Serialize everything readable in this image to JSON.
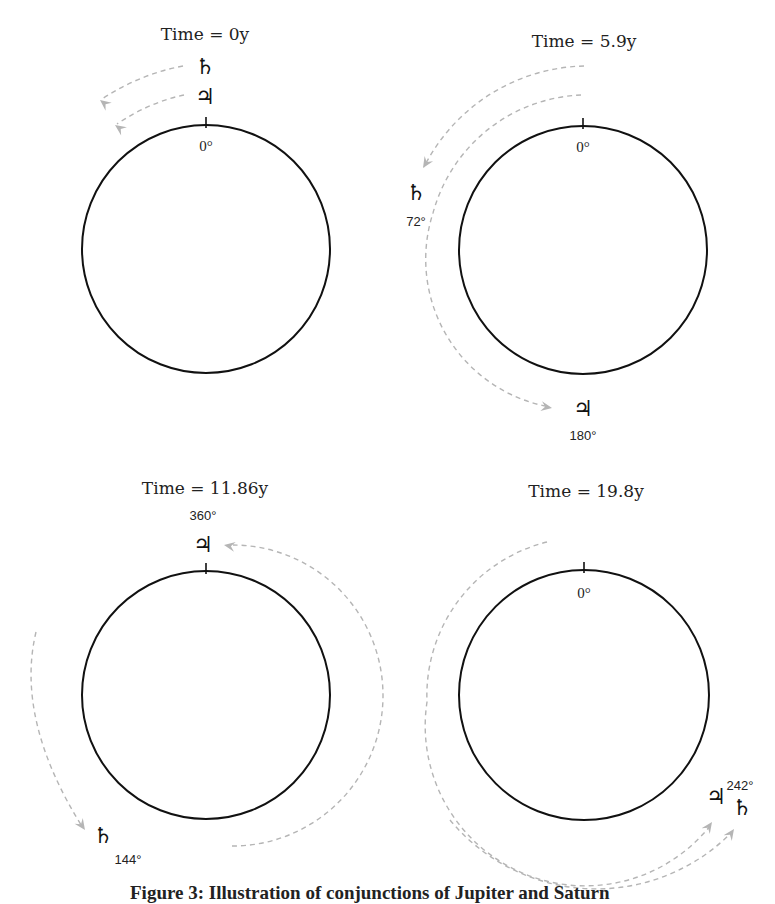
{
  "figure": {
    "caption": "Figure 3: Illustration of  conjunctions of Jupiter and Saturn",
    "colors": {
      "orbit": "#111111",
      "arc": "#b5b5b5",
      "text": "#222222"
    },
    "symbols": {
      "jupiter": "♃",
      "saturn": "♄"
    },
    "panels": [
      {
        "id": "t0",
        "title": "Time = 0y",
        "title_pos": [
          205,
          40
        ],
        "circle": {
          "cx": 206,
          "cy": 249,
          "r": 124
        },
        "zero_label": {
          "text": "0°",
          "x": 206,
          "y": 151
        },
        "bodies": [
          {
            "name": "saturn",
            "symbol": "♄",
            "x": 205,
            "y": 74
          },
          {
            "name": "jupiter",
            "symbol": "♃",
            "x": 205,
            "y": 104
          }
        ],
        "angle_labels": [],
        "arcs": [
          {
            "d": "M 183 66 Q 140 74 102 99",
            "arrow": [
              100,
              100,
              218
            ]
          },
          {
            "d": "M 184 95 Q 150 102 117 124",
            "arrow": [
              115,
              125,
              215
            ]
          }
        ]
      },
      {
        "id": "t5_9",
        "title": "Time = 5.9y",
        "title_pos": [
          584,
          47
        ],
        "circle": {
          "cx": 583,
          "cy": 250,
          "r": 124
        },
        "zero_label": {
          "text": "0°",
          "x": 583,
          "y": 152
        },
        "bodies": [
          {
            "name": "saturn",
            "symbol": "♄",
            "x": 416,
            "y": 200
          },
          {
            "name": "jupiter",
            "symbol": "♃",
            "x": 583,
            "y": 416
          }
        ],
        "angle_labels": [
          {
            "text": "72°",
            "x": 416,
            "y": 226,
            "cls": "deg"
          },
          {
            "text": "180°",
            "x": 583,
            "y": 440,
            "cls": "deg"
          }
        ],
        "arcs": [
          {
            "d": "M 584 66 A 184 184 0 0 0 424 167",
            "arrow": [
              423,
              168,
              122
            ]
          },
          {
            "d": "M 581 95 A 160 160 0 0 0 433 213 A 150 150 0 0 0 545 406",
            "arrow": [
              552,
              408,
              10
            ]
          }
        ]
      },
      {
        "id": "t11_86",
        "title": "Time = 11.86y",
        "title_pos": [
          205,
          494
        ],
        "circle": {
          "cx": 206,
          "cy": 695,
          "r": 124
        },
        "zero_label": null,
        "bodies": [
          {
            "name": "jupiter",
            "symbol": "♃",
            "x": 203,
            "y": 552
          }
        ],
        "angle_labels": [
          {
            "text": "360°",
            "x": 203,
            "y": 520,
            "cls": "deg"
          },
          {
            "text": "144°",
            "x": 128,
            "y": 864,
            "cls": "deg"
          }
        ],
        "saturn": {
          "symbol": "♄",
          "x": 103,
          "y": 843
        },
        "arcs": [
          {
            "d": "M 36 632 Q 15 720 83 828",
            "arrow": [
              85,
              830,
              55
            ]
          },
          {
            "d": "M 232 740 M 232 846 A 150 150 0 0 0 233 545",
            "arrow": [
              224,
              545,
              190
            ]
          }
        ]
      },
      {
        "id": "t19_8",
        "title": "Time = 19.8y",
        "title_pos": [
          586,
          497
        ],
        "circle": {
          "cx": 584,
          "cy": 695,
          "r": 125
        },
        "zero_label": {
          "text": "0°",
          "x": 584,
          "y": 598
        },
        "bodies": [
          {
            "name": "jupiter",
            "symbol": "♃",
            "x": 716,
            "y": 804
          },
          {
            "name": "saturn",
            "symbol": "♄",
            "x": 742,
            "y": 815
          }
        ],
        "angle_labels": [
          {
            "text": "242°",
            "x": 740,
            "y": 790,
            "cls": "deg"
          }
        ],
        "arcs": [
          {
            "d": "M 547 542 A 158 158 0 0 0 427 702 A 160 160 0 0 0 710 826",
            "arrow": [
              712,
              822,
              -55
            ]
          },
          {
            "d": "M 450 820 A 190 190 0 0 0 731 833",
            "arrow": [
              734,
              829,
              -55
            ]
          }
        ]
      }
    ]
  }
}
